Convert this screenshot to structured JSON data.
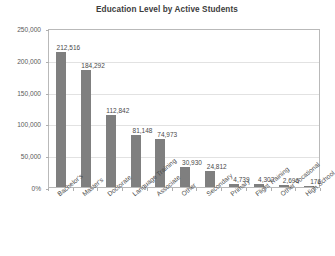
{
  "chart_data": {
    "type": "bar",
    "title": "Education Level by Active Students",
    "xlabel": "",
    "ylabel": "",
    "ylim": [
      0,
      250000
    ],
    "grid": true,
    "legend": false,
    "orientation": "vertical",
    "bar_color": "#7f7f7f",
    "categories": [
      "Bachelor's",
      "Master's",
      "Doctorate",
      "Language Training",
      "Associate",
      "Other",
      "Secondary",
      "Primary",
      "Flight Training",
      "Other Vocational",
      "High School"
    ],
    "values": [
      212516,
      184292,
      112842,
      81148,
      74973,
      30930,
      24812,
      4739,
      4302,
      2696,
      176
    ],
    "value_labels": [
      "212,516",
      "184,292",
      "112,842",
      "81,148",
      "74,973",
      "30,930",
      "24,812",
      "4,739",
      "4,302",
      "2,696",
      "176"
    ],
    "yticks": [
      0,
      50000,
      100000,
      150000,
      200000,
      250000
    ],
    "ytick_labels": [
      "0%",
      "50,000",
      "100,000",
      "150,000",
      "200,000",
      "250,000"
    ]
  }
}
